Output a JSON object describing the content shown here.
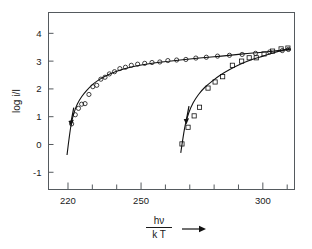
{
  "chart_data": {
    "type": "scatter",
    "title": "",
    "subtitle": "",
    "xlabel": "hν / k T",
    "xlabel_numerator": "hν",
    "xlabel_denominator": "k T",
    "xlabel_arrow": "→",
    "ylabel": "log i/I",
    "xlim": [
      212,
      313
    ],
    "ylim": [
      -1.62,
      4.75
    ],
    "grid": false,
    "legend_position": "none",
    "xticks_major": [
      220,
      250,
      300
    ],
    "xtick_labels": [
      "220",
      "250",
      "300"
    ],
    "xticks_minor": [
      220,
      230,
      240,
      250,
      260,
      270,
      280,
      290,
      300,
      310
    ],
    "yticks": [
      -1,
      0,
      1,
      2,
      3,
      4
    ],
    "ytick_labels": [
      "-1",
      "0",
      "1",
      "2",
      "3",
      "4"
    ],
    "series": [
      {
        "name": "series-circles",
        "marker": "circle",
        "points": [
          {
            "x": 221.5,
            "y": 0.74
          },
          {
            "x": 223.0,
            "y": 1.07
          },
          {
            "x": 224.3,
            "y": 1.3
          },
          {
            "x": 225.6,
            "y": 1.45
          },
          {
            "x": 227.0,
            "y": 1.47
          },
          {
            "x": 228.6,
            "y": 1.8
          },
          {
            "x": 230.2,
            "y": 2.08
          },
          {
            "x": 231.8,
            "y": 2.13
          },
          {
            "x": 233.5,
            "y": 2.35
          },
          {
            "x": 235.2,
            "y": 2.42
          },
          {
            "x": 237.0,
            "y": 2.54
          },
          {
            "x": 239.1,
            "y": 2.62
          },
          {
            "x": 241.3,
            "y": 2.73
          },
          {
            "x": 243.6,
            "y": 2.78
          },
          {
            "x": 246.0,
            "y": 2.85
          },
          {
            "x": 248.6,
            "y": 2.89
          },
          {
            "x": 251.5,
            "y": 2.92
          },
          {
            "x": 254.5,
            "y": 2.95
          },
          {
            "x": 257.7,
            "y": 2.97
          },
          {
            "x": 261.0,
            "y": 3.02
          },
          {
            "x": 264.6,
            "y": 3.04
          },
          {
            "x": 268.4,
            "y": 3.06
          },
          {
            "x": 272.5,
            "y": 3.11
          },
          {
            "x": 276.8,
            "y": 3.14
          },
          {
            "x": 281.4,
            "y": 3.18
          },
          {
            "x": 286.3,
            "y": 3.21
          },
          {
            "x": 291.5,
            "y": 3.24
          },
          {
            "x": 297.0,
            "y": 3.28
          },
          {
            "x": 302.8,
            "y": 3.33
          },
          {
            "x": 308.0,
            "y": 3.38
          },
          {
            "x": 310.5,
            "y": 3.42
          }
        ],
        "fit_curve": [
          {
            "x": 219.6,
            "y": -0.38
          },
          {
            "x": 220.4,
            "y": 0.18
          },
          {
            "x": 221.3,
            "y": 0.72
          },
          {
            "x": 222.4,
            "y": 1.12
          },
          {
            "x": 223.8,
            "y": 1.45
          },
          {
            "x": 225.6,
            "y": 1.72
          },
          {
            "x": 227.8,
            "y": 1.96
          },
          {
            "x": 230.4,
            "y": 2.18
          },
          {
            "x": 233.5,
            "y": 2.37
          },
          {
            "x": 237.2,
            "y": 2.54
          },
          {
            "x": 241.5,
            "y": 2.68
          },
          {
            "x": 246.5,
            "y": 2.8
          },
          {
            "x": 252.0,
            "y": 2.89
          },
          {
            "x": 258.5,
            "y": 2.97
          },
          {
            "x": 266.0,
            "y": 3.04
          },
          {
            "x": 274.0,
            "y": 3.11
          },
          {
            "x": 283.0,
            "y": 3.18
          },
          {
            "x": 292.0,
            "y": 3.26
          },
          {
            "x": 301.0,
            "y": 3.33
          },
          {
            "x": 311.5,
            "y": 3.43
          }
        ],
        "arrow": {
          "x": 221.3,
          "y": 0.82,
          "direction": "down-left"
        }
      },
      {
        "name": "series-squares",
        "marker": "square",
        "points": [
          {
            "x": 266.8,
            "y": 0.02
          },
          {
            "x": 269.3,
            "y": 0.62
          },
          {
            "x": 271.8,
            "y": 1.03
          },
          {
            "x": 274.0,
            "y": 1.34
          },
          {
            "x": 277.5,
            "y": 2.03
          },
          {
            "x": 280.4,
            "y": 2.25
          },
          {
            "x": 283.5,
            "y": 2.44
          },
          {
            "x": 287.5,
            "y": 2.85
          },
          {
            "x": 291.3,
            "y": 3.0
          },
          {
            "x": 294.4,
            "y": 3.12
          },
          {
            "x": 297.3,
            "y": 3.12
          },
          {
            "x": 300.5,
            "y": 3.26
          },
          {
            "x": 304.0,
            "y": 3.36
          },
          {
            "x": 307.5,
            "y": 3.44
          },
          {
            "x": 310.3,
            "y": 3.47
          }
        ],
        "fit_curve": [
          {
            "x": 266.3,
            "y": -0.3
          },
          {
            "x": 267.2,
            "y": 0.22
          },
          {
            "x": 268.2,
            "y": 0.72
          },
          {
            "x": 269.6,
            "y": 1.14
          },
          {
            "x": 271.4,
            "y": 1.5
          },
          {
            "x": 273.6,
            "y": 1.8
          },
          {
            "x": 276.2,
            "y": 2.06
          },
          {
            "x": 279.2,
            "y": 2.28
          },
          {
            "x": 282.6,
            "y": 2.5
          },
          {
            "x": 286.4,
            "y": 2.7
          },
          {
            "x": 290.5,
            "y": 2.88
          },
          {
            "x": 295.0,
            "y": 3.04
          },
          {
            "x": 300.0,
            "y": 3.18
          },
          {
            "x": 305.2,
            "y": 3.32
          },
          {
            "x": 311.0,
            "y": 3.46
          }
        ],
        "arrow": {
          "x": 268.6,
          "y": 0.88,
          "direction": "down-left"
        }
      }
    ]
  },
  "axes": {
    "ylabel": "log i/I",
    "xlabel_numerator": "hν",
    "xlabel_denominator": "k T"
  }
}
